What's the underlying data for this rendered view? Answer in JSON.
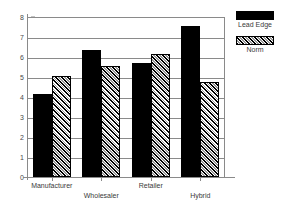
{
  "chart_data": {
    "type": "bar",
    "title": "",
    "subtitle": "",
    "xlabel": "",
    "ylabel": "",
    "categories": [
      "Manufacturer",
      "Wholesaler",
      "Retailer",
      "Hybrid"
    ],
    "series": [
      {
        "name": "Lead Edge",
        "values": [
          4.15,
          6.35,
          5.7,
          7.55
        ],
        "fill": "solid",
        "color": "#000000"
      },
      {
        "name": "Norm",
        "values": [
          5.05,
          5.55,
          6.17,
          4.75
        ],
        "fill": "diagonal-hatch",
        "color": "#d2d2d2"
      }
    ],
    "ylim": [
      0,
      8
    ],
    "yticks": [
      0,
      1,
      2,
      3,
      4,
      5,
      6,
      7,
      8
    ],
    "ytick_labels": [
      "0",
      "1",
      "2",
      "3",
      "4",
      "5",
      "6",
      "7",
      "8"
    ],
    "grid": true,
    "grid_axis": "y",
    "legend_position": "right",
    "xtick_labels_staggered": true,
    "colors": {
      "axis": "#8a8a8a",
      "grid": "#8a8a8a",
      "text": "#3a3a3a",
      "series_lead_edge": "#000000",
      "series_norm": "#d2d2d2"
    }
  },
  "legend": {
    "items": [
      {
        "label": "Lead Edge"
      },
      {
        "label": "Norm"
      }
    ]
  }
}
